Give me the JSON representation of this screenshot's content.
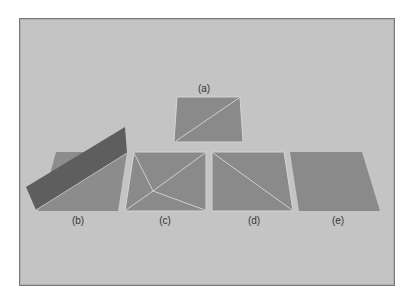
{
  "figure": {
    "background": "#c4c4c4",
    "panel_fill": "#8a8a8a",
    "slab_fill": "#5e5e5e",
    "edge_color": "#cfcfcf",
    "labels": {
      "a": "(a)",
      "b": "(b)",
      "c": "(c)",
      "d": "(d)",
      "e": "(e)"
    }
  }
}
